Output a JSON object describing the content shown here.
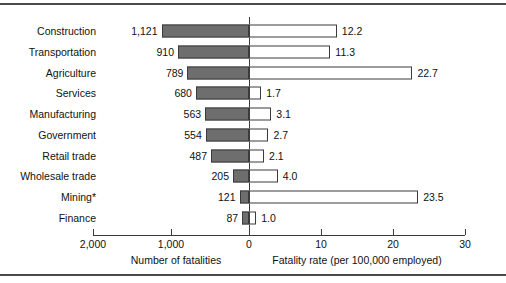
{
  "chart_data": {
    "type": "bar",
    "title": "",
    "orientation": "horizontal",
    "style": "back-to-back bidirectional bars",
    "categories": [
      "Construction",
      "Transportation",
      "Agriculture",
      "Services",
      "Manufacturing",
      "Government",
      "Retail trade",
      "Wholesale trade",
      "Mining*",
      "Finance"
    ],
    "series": [
      {
        "name": "Number of fatalities",
        "direction": "left",
        "fill": "#6e6e6e",
        "values": [
          1121,
          910,
          789,
          680,
          563,
          554,
          487,
          205,
          121,
          87
        ],
        "value_labels": [
          "1,121",
          "910",
          "789",
          "680",
          "563",
          "554",
          "487",
          "205",
          "121",
          "87"
        ],
        "axis_title": "Number of fatalities",
        "ticks": [
          2000,
          1000,
          0
        ],
        "tick_labels": [
          "2,000",
          "1,000",
          "0"
        ],
        "axis_min": 0,
        "axis_max": 2000
      },
      {
        "name": "Fatality rate (per 100,000 employed)",
        "direction": "right",
        "fill": "#ffffff",
        "values": [
          12.2,
          11.3,
          22.7,
          1.7,
          3.1,
          2.7,
          2.1,
          4.0,
          23.5,
          1.0
        ],
        "value_labels": [
          "12.2",
          "11.3",
          "22.7",
          "1.7",
          "3.1",
          "2.7",
          "2.1",
          "4.0",
          "23.5",
          "1.0"
        ],
        "axis_title": "Fatality rate (per 100,000 employed)",
        "ticks": [
          0,
          10,
          20,
          30
        ],
        "tick_labels": [
          "0",
          "10",
          "20",
          "30"
        ],
        "axis_min": 0,
        "axis_max": 30
      }
    ],
    "grid": false,
    "legend": "none",
    "footnote_marker": "*"
  },
  "colors": {
    "bar_fill_left": "#6e6e6e",
    "bar_fill_right": "#ffffff",
    "bar_stroke": "#3b3b3b",
    "axis": "#3a3a3a",
    "rule": "#4a4a4a",
    "text": "#111111",
    "background": "#ffffff"
  }
}
